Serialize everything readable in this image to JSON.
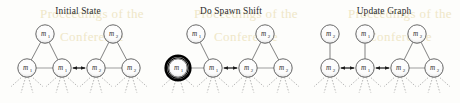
{
  "figure": {
    "width": 460,
    "height": 103,
    "background_color": "#fdfdfb",
    "watermark_color": "#efe7c8",
    "node_fill": "#ffffff",
    "node_stroke": "#585858",
    "tree_edge_color": "#6b6b6b",
    "gray_edge_color": "#bdbdbd",
    "dark_edge_color": "#1c1c1c",
    "highlight_ring_color": "#000000",
    "dashed_leaf_color": "#9a9a9a"
  },
  "watermark": {
    "line1": "Proceedings of the",
    "line2": "Conference"
  },
  "panels": [
    {
      "id": "initial-state",
      "title": "Initial State",
      "title_x": 78,
      "title_y": 14,
      "top_nodes": [
        {
          "label": "m",
          "sub": "1",
          "x": 45,
          "y": 34,
          "r": 9.2
        },
        {
          "label": "m",
          "sub": "2",
          "x": 113,
          "y": 34,
          "r": 9.2
        }
      ],
      "bottom_nodes": [
        {
          "label": "m",
          "sub": "1",
          "x": 27,
          "y": 68,
          "r": 9.2,
          "highlighted": false
        },
        {
          "label": "m",
          "sub": "1",
          "x": 62,
          "y": 68,
          "r": 9.2,
          "highlighted": false
        },
        {
          "label": "m",
          "sub": "2",
          "x": 96,
          "y": 68,
          "r": 9.2,
          "highlighted": false
        },
        {
          "label": "m",
          "sub": "2",
          "x": 131,
          "y": 68,
          "r": 9.2,
          "highlighted": false
        }
      ],
      "tree_edges": [
        {
          "from_top": 0,
          "to_bottom": 0
        },
        {
          "from_top": 0,
          "to_bottom": 1
        },
        {
          "from_top": 1,
          "to_bottom": 2
        },
        {
          "from_top": 1,
          "to_bottom": 3
        }
      ],
      "chain_edges": [
        {
          "from": 0,
          "to": 1,
          "style": "gray"
        },
        {
          "from": 1,
          "to": 2,
          "style": "dark-arrow"
        },
        {
          "from": 2,
          "to": 3,
          "style": "gray"
        }
      ]
    },
    {
      "id": "do-spawn-shift",
      "title": "Do Spawn Shift",
      "title_x": 231,
      "title_y": 14,
      "top_nodes": [
        {
          "label": "m",
          "sub": "1",
          "x": 196,
          "y": 34,
          "r": 9.2
        },
        {
          "label": "m",
          "sub": "2",
          "x": 265,
          "y": 34,
          "r": 9.2
        }
      ],
      "bottom_nodes": [
        {
          "label": "m",
          "sub": "1",
          "x": 178,
          "y": 68,
          "r": 9.2,
          "highlighted": true
        },
        {
          "label": "m",
          "sub": "1",
          "x": 213,
          "y": 68,
          "r": 9.2,
          "highlighted": false
        },
        {
          "label": "m",
          "sub": "2",
          "x": 248,
          "y": 68,
          "r": 9.2,
          "highlighted": false
        },
        {
          "label": "m",
          "sub": "2",
          "x": 283,
          "y": 68,
          "r": 9.2,
          "highlighted": false
        }
      ],
      "tree_edges": [
        {
          "from_top": 0,
          "to_bottom": 1
        },
        {
          "from_top": 1,
          "to_bottom": 2
        },
        {
          "from_top": 1,
          "to_bottom": 3
        }
      ],
      "chain_edges": [
        {
          "from": 0,
          "to": 1,
          "style": "gray"
        },
        {
          "from": 1,
          "to": 2,
          "style": "dark-arrow"
        },
        {
          "from": 2,
          "to": 3,
          "style": "gray"
        }
      ]
    },
    {
      "id": "update-graph",
      "title": "Update Graph",
      "title_x": 384,
      "title_y": 14,
      "top_nodes": [
        {
          "label": "m",
          "sub": "2",
          "x": 330,
          "y": 34,
          "r": 9.2
        },
        {
          "label": "m",
          "sub": "1",
          "x": 365,
          "y": 34,
          "r": 9.2
        },
        {
          "label": "m",
          "sub": "2",
          "x": 417,
          "y": 34,
          "r": 9.2
        }
      ],
      "bottom_nodes": [
        {
          "label": "m",
          "sub": "2",
          "x": 330,
          "y": 68,
          "r": 9.2,
          "highlighted": false
        },
        {
          "label": "m",
          "sub": "1",
          "x": 365,
          "y": 68,
          "r": 9.2,
          "highlighted": false
        },
        {
          "label": "m",
          "sub": "2",
          "x": 400,
          "y": 68,
          "r": 9.2,
          "highlighted": false
        },
        {
          "label": "m",
          "sub": "2",
          "x": 434,
          "y": 68,
          "r": 9.2,
          "highlighted": false
        }
      ],
      "tree_edges": [
        {
          "from_top": 0,
          "to_bottom": 0
        },
        {
          "from_top": 1,
          "to_bottom": 1
        },
        {
          "from_top": 2,
          "to_bottom": 2
        },
        {
          "from_top": 2,
          "to_bottom": 3
        }
      ],
      "chain_edges": [
        {
          "from": 0,
          "to": 1,
          "style": "dark-arrow"
        },
        {
          "from": 1,
          "to": 2,
          "style": "dark-arrow"
        },
        {
          "from": 2,
          "to": 3,
          "style": "gray"
        }
      ]
    }
  ],
  "leaf_fan": {
    "count": 4,
    "length": 13,
    "spread_deg": 46,
    "description": "dashed rays fanning downward from each bottom node"
  }
}
